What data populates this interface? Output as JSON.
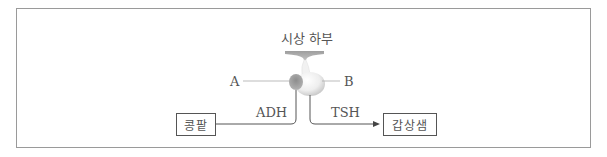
{
  "diagram": {
    "title_label": "시상 하부",
    "label_a": "A",
    "label_b": "B",
    "arrow_left_label": "ADH",
    "arrow_right_label": "TSH",
    "target_left": "콩팥",
    "target_right": "갑상샘",
    "colors": {
      "frame": "#9a9a9a",
      "line": "#555555",
      "hypothalamus": "#a9a9a9",
      "posterior_lobe": "#8a8a8a",
      "anterior_lobe": "#e6e6e6"
    }
  }
}
